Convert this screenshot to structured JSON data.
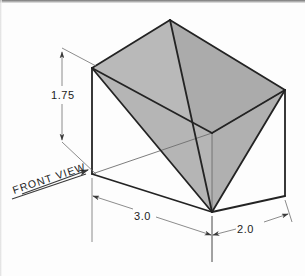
{
  "drawing": {
    "title": "Isometric pictorial of rectangular block with inscribed shaded wedge",
    "view_label": "FRONT VIEW",
    "colors": {
      "paper": "#fdfdfd",
      "ink": "#1c1c1c",
      "object_line": "#232323",
      "thin_line": "#6e6e6e",
      "shaded_face": "#b9b9b9",
      "shaded_face_dark": "#ababab"
    },
    "dimensions": [
      {
        "name": "height",
        "value": "1.75",
        "orientation": "vertical",
        "position": "left"
      },
      {
        "name": "length",
        "value": "3.0",
        "orientation": "isometric-left",
        "position": "bottom-left"
      },
      {
        "name": "depth",
        "value": "2.0",
        "orientation": "isometric-right",
        "position": "bottom-right"
      }
    ],
    "annotation": {
      "text": "FRONT VIEW",
      "underlined": true,
      "arrow_direction": "up-right"
    }
  }
}
